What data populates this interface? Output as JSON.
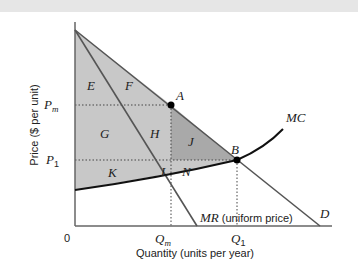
{
  "figure": {
    "colors": {
      "light_region": "#c8c8c8",
      "dark_region": "#a9a9a9",
      "lines": "#555555",
      "mc_curve": "#111111",
      "top_band": "#e6e6e6"
    },
    "axes": {
      "ylabel": "Price ($ per unit)",
      "xlabel": "Quantity (units per year)",
      "origin": "0"
    },
    "price_labels": {
      "pm_main": "P",
      "pm_sub": "m",
      "p1_main": "P",
      "p1_sub": "1"
    },
    "quantity_labels": {
      "qm_main": "Q",
      "qm_sub": "m",
      "q1_main": "Q",
      "q1_sub": "1"
    },
    "curves": {
      "mc": "MC",
      "mr_italic": "MR",
      "mr_note": " (uniform price)",
      "demand": "D"
    },
    "points": {
      "a": "A",
      "b": "B"
    },
    "regions": {
      "e": "E",
      "f": "F",
      "g": "G",
      "h": "H",
      "j": "J",
      "k": "K",
      "l": "L",
      "n": "N"
    }
  }
}
